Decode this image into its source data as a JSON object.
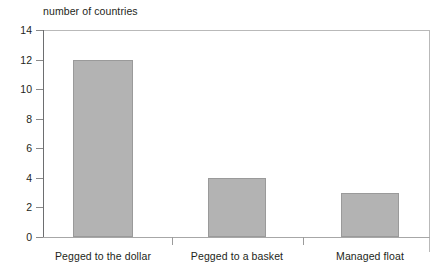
{
  "chart_data": {
    "type": "bar",
    "title": "",
    "xlabel": "",
    "ylabel": "number of countries",
    "ylim": [
      0,
      14
    ],
    "yticks": [
      0,
      2,
      4,
      6,
      8,
      10,
      12,
      14
    ],
    "grid": false,
    "legend": null,
    "categories": [
      "Pegged to the dollar",
      "Pegged to a basket",
      "Managed float"
    ],
    "values": [
      12,
      4,
      3
    ],
    "bar_color": "#b3b3b3",
    "bar_edge_color": "#9a9a9a",
    "axis_color": "#6d6e70",
    "text_color": "#231f20"
  }
}
